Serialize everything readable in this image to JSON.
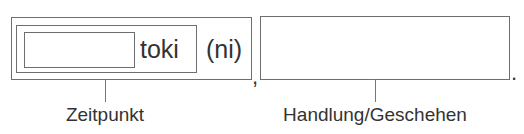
{
  "diagram": {
    "left_group": {
      "particle": "toki",
      "optional_particle": "(ni)",
      "label": "Zeitpunkt"
    },
    "separator": ",",
    "right_group": {
      "label": "Handlung/Geschehen"
    },
    "terminator": "."
  }
}
